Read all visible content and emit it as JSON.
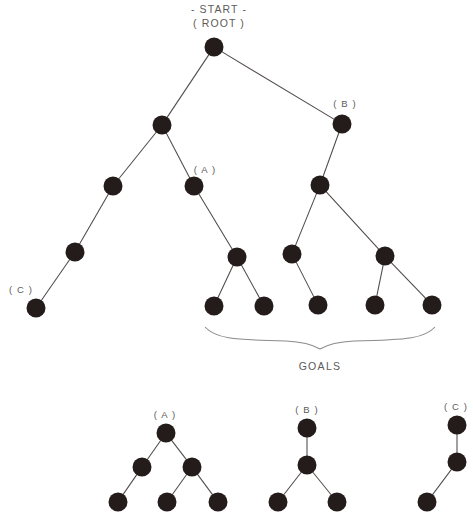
{
  "diagram": {
    "title_lines": [
      "- START -",
      "( ROOT )"
    ],
    "goals_label": "GOALS",
    "node_labels": {
      "a_main": "( A )",
      "b_main": "( B )",
      "c_main": "( C )",
      "a_sub": "( A )",
      "b_sub": "( B )",
      "c_sub": "( C )"
    },
    "colors": {
      "node_fill": "#231c1a",
      "edge_stroke": "#4f4a48",
      "brace_stroke": "#8d8a88",
      "text": "#5d5a58",
      "background": "#ffffff"
    }
  },
  "chart_data": {
    "type": "diagram",
    "title": "- START - ( ROOT )",
    "node_radius": 9.5,
    "main_tree": {
      "nodes": [
        {
          "id": "root",
          "x": 214,
          "y": 47,
          "label": "( ROOT )"
        },
        {
          "id": "n1",
          "x": 162,
          "y": 125,
          "label": ""
        },
        {
          "id": "nB",
          "x": 342,
          "y": 124,
          "label": "( B )"
        },
        {
          "id": "n2",
          "x": 113,
          "y": 186,
          "label": ""
        },
        {
          "id": "nA",
          "x": 194,
          "y": 186,
          "label": "( A )"
        },
        {
          "id": "n3",
          "x": 320,
          "y": 185,
          "label": ""
        },
        {
          "id": "n4",
          "x": 75,
          "y": 252,
          "label": ""
        },
        {
          "id": "n5",
          "x": 237,
          "y": 257,
          "label": ""
        },
        {
          "id": "n6",
          "x": 292,
          "y": 254,
          "label": ""
        },
        {
          "id": "n7",
          "x": 385,
          "y": 256,
          "label": ""
        },
        {
          "id": "nC",
          "x": 36,
          "y": 308,
          "label": "( C )"
        },
        {
          "id": "g1",
          "x": 214,
          "y": 306,
          "label": ""
        },
        {
          "id": "g2",
          "x": 264,
          "y": 306,
          "label": ""
        },
        {
          "id": "g3",
          "x": 318,
          "y": 305,
          "label": ""
        },
        {
          "id": "g4",
          "x": 375,
          "y": 305,
          "label": ""
        },
        {
          "id": "g5",
          "x": 432,
          "y": 305,
          "label": ""
        }
      ],
      "edges": [
        [
          "root",
          "n1"
        ],
        [
          "root",
          "nB"
        ],
        [
          "n1",
          "n2"
        ],
        [
          "n1",
          "nA"
        ],
        [
          "nB",
          "n3"
        ],
        [
          "n2",
          "n4"
        ],
        [
          "n4",
          "nC"
        ],
        [
          "nA",
          "n5"
        ],
        [
          "n5",
          "g1"
        ],
        [
          "n5",
          "g2"
        ],
        [
          "n3",
          "n6"
        ],
        [
          "n3",
          "n7"
        ],
        [
          "n6",
          "g3"
        ],
        [
          "n7",
          "g4"
        ],
        [
          "n7",
          "g5"
        ]
      ],
      "goal_nodes": [
        "g1",
        "g2",
        "g3",
        "g4",
        "g5"
      ]
    },
    "subtrees": [
      {
        "name": "( A )",
        "nodes": [
          {
            "id": "a0",
            "x": 166,
            "y": 433
          },
          {
            "id": "a1",
            "x": 142,
            "y": 467
          },
          {
            "id": "a2",
            "x": 192,
            "y": 467
          },
          {
            "id": "a3",
            "x": 118,
            "y": 502
          },
          {
            "id": "a4",
            "x": 167,
            "y": 502
          },
          {
            "id": "a5",
            "x": 218,
            "y": 502
          }
        ],
        "edges": [
          [
            "a0",
            "a1"
          ],
          [
            "a0",
            "a2"
          ],
          [
            "a1",
            "a3"
          ],
          [
            "a2",
            "a4"
          ],
          [
            "a2",
            "a5"
          ]
        ],
        "label_pos": {
          "x": 165,
          "y": 414
        }
      },
      {
        "name": "( B )",
        "nodes": [
          {
            "id": "b0",
            "x": 307,
            "y": 428
          },
          {
            "id": "b1",
            "x": 307,
            "y": 465
          },
          {
            "id": "b2",
            "x": 278,
            "y": 502
          },
          {
            "id": "b3",
            "x": 337,
            "y": 502
          }
        ],
        "edges": [
          [
            "b0",
            "b1"
          ],
          [
            "b1",
            "b2"
          ],
          [
            "b1",
            "b3"
          ]
        ],
        "label_pos": {
          "x": 307,
          "y": 409
        }
      },
      {
        "name": "( C )",
        "nodes": [
          {
            "id": "c0",
            "x": 457,
            "y": 425
          },
          {
            "id": "c1",
            "x": 457,
            "y": 462
          },
          {
            "id": "c2",
            "x": 427,
            "y": 502
          }
        ],
        "edges": [
          [
            "c0",
            "c1"
          ],
          [
            "c1",
            "c2"
          ]
        ],
        "label_pos": {
          "x": 456,
          "y": 406
        }
      }
    ],
    "brace": {
      "left_x": 205,
      "right_x": 435,
      "top_y": 327,
      "label": "GOALS",
      "label_x": 320,
      "label_y": 366
    }
  }
}
